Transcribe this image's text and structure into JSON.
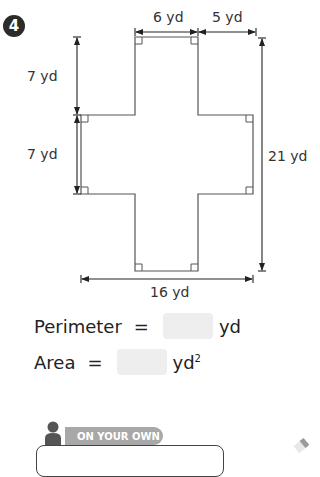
{
  "problem": {
    "number": "4",
    "labels": {
      "top_width": "6 yd",
      "top_right_offset": "5 yd",
      "left_upper_height": "7 yd",
      "left_middle_height": "7 yd",
      "total_height": "21 yd",
      "total_width": "16 yd"
    }
  },
  "answers": {
    "perimeter_label": "Perimeter",
    "perimeter_equals": "=",
    "perimeter_value": "",
    "perimeter_unit": "yd",
    "area_label": "Area",
    "area_equals": "=",
    "area_value": "",
    "area_unit": "yd",
    "area_unit_exp": "2"
  },
  "on_your_own": {
    "label": "ON YOUR OWN"
  },
  "colors": {
    "shape_stroke": "#555555",
    "answer_box": "#eeeeee",
    "tab": "#a8a8a8",
    "badge": "#2b2b2b"
  }
}
